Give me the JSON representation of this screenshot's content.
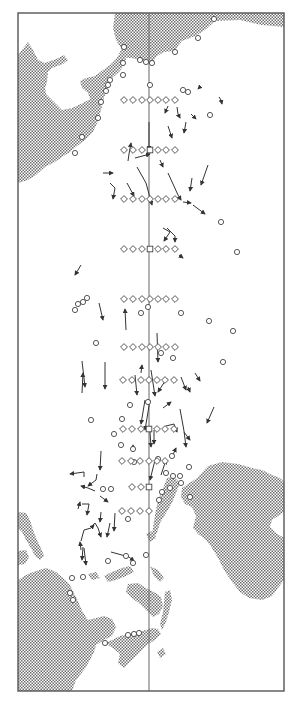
{
  "figure": {
    "type": "oceanographic station and drift-track map",
    "width": 290,
    "height": 707,
    "frame": {
      "x": 18,
      "y": 13,
      "w": 266,
      "h": 678
    },
    "meridian_x": 149,
    "colors": {
      "land_dot": "#7a7a7a",
      "line": "#333333",
      "frame": "#555555",
      "background": "#ffffff"
    }
  },
  "legend": {
    "diamond": "hydrographic station",
    "square": "station on reference meridian",
    "circle": "coastal / island observation site",
    "arrow": "drift trajectory"
  },
  "station_rows": [
    {
      "y": 100,
      "xs": [
        124,
        133,
        142,
        150,
        158,
        166,
        175
      ]
    },
    {
      "y": 150,
      "xs": [
        124,
        133,
        142,
        150,
        158,
        166,
        175
      ]
    },
    {
      "y": 199,
      "xs": [
        124,
        133,
        142,
        150,
        158,
        166,
        175
      ]
    },
    {
      "y": 249,
      "xs": [
        124,
        133,
        142,
        150,
        158,
        166,
        175
      ]
    },
    {
      "y": 299,
      "xs": [
        124,
        133,
        142,
        150,
        158,
        166,
        175
      ]
    },
    {
      "y": 347,
      "xs": [
        124,
        133,
        142,
        150,
        158,
        166,
        175
      ]
    },
    {
      "y": 380,
      "xs": [
        123,
        132,
        141,
        149,
        157,
        165,
        174
      ]
    },
    {
      "y": 429,
      "xs": [
        123,
        132,
        141,
        149,
        157,
        165,
        174
      ]
    },
    {
      "y": 461,
      "xs": [
        122,
        131,
        140,
        149,
        157,
        165
      ]
    },
    {
      "y": 487,
      "xs": [
        132,
        141,
        149
      ]
    },
    {
      "y": 511,
      "xs": [
        122,
        131,
        140,
        149
      ]
    }
  ],
  "square_stations": [
    {
      "x": 150,
      "y": 150
    },
    {
      "x": 150,
      "y": 249
    },
    {
      "x": 149,
      "y": 429
    },
    {
      "x": 149,
      "y": 487
    },
    {
      "x": 149,
      "y": 347
    }
  ],
  "circles": [
    [
      124,
      47
    ],
    [
      140,
      60
    ],
    [
      146,
      62
    ],
    [
      152,
      63
    ],
    [
      175,
      52
    ],
    [
      198,
      38
    ],
    [
      214,
      19
    ],
    [
      123,
      63
    ],
    [
      123,
      75
    ],
    [
      110,
      80
    ],
    [
      108,
      85
    ],
    [
      106,
      91
    ],
    [
      101,
      102
    ],
    [
      98,
      118
    ],
    [
      82,
      137
    ],
    [
      75,
      153
    ],
    [
      150,
      85
    ],
    [
      183,
      90
    ],
    [
      188,
      92
    ],
    [
      210,
      115
    ],
    [
      221,
      222
    ],
    [
      237,
      252
    ],
    [
      87,
      298
    ],
    [
      83,
      302
    ],
    [
      78,
      304
    ],
    [
      75,
      310
    ],
    [
      96,
      343
    ],
    [
      148,
      307
    ],
    [
      141,
      313
    ],
    [
      181,
      313
    ],
    [
      233,
      331
    ],
    [
      209,
      321
    ],
    [
      223,
      362
    ],
    [
      173,
      358
    ],
    [
      161,
      353
    ],
    [
      148,
      402
    ],
    [
      130,
      405
    ],
    [
      91,
      420
    ],
    [
      122,
      419
    ],
    [
      114,
      434
    ],
    [
      121,
      445
    ],
    [
      133,
      449
    ],
    [
      134,
      462
    ],
    [
      158,
      459
    ],
    [
      170,
      488
    ],
    [
      162,
      492
    ],
    [
      159,
      500
    ],
    [
      172,
      456
    ],
    [
      166,
      473
    ],
    [
      173,
      476
    ],
    [
      180,
      476
    ],
    [
      189,
      467
    ],
    [
      181,
      483
    ],
    [
      190,
      497
    ],
    [
      103,
      489
    ],
    [
      111,
      489
    ],
    [
      128,
      519
    ],
    [
      146,
      555
    ],
    [
      126,
      556
    ],
    [
      133,
      563
    ],
    [
      72,
      578
    ],
    [
      83,
      577
    ],
    [
      108,
      561
    ],
    [
      70,
      593
    ],
    [
      73,
      600
    ],
    [
      128,
      635
    ],
    [
      134,
      634
    ],
    [
      139,
      633
    ],
    [
      105,
      643
    ]
  ],
  "tracks": [
    [
      [
        219,
        97
      ],
      [
        221,
        100
      ],
      [
        222,
        104
      ]
    ],
    [
      [
        201,
        86
      ],
      [
        198,
        89
      ]
    ],
    [
      [
        168,
        106
      ],
      [
        165,
        113
      ]
    ],
    [
      [
        177,
        107
      ],
      [
        178,
        114
      ],
      [
        180,
        118
      ]
    ],
    [
      [
        191,
        114
      ],
      [
        196,
        119
      ]
    ],
    [
      [
        186,
        122
      ],
      [
        184,
        133
      ]
    ],
    [
      [
        168,
        126
      ],
      [
        172,
        138
      ]
    ],
    [
      [
        149,
        122
      ],
      [
        149,
        150
      ]
    ],
    [
      [
        128,
        161
      ],
      [
        129,
        154
      ],
      [
        131,
        143
      ]
    ],
    [
      [
        135,
        158
      ],
      [
        150,
        154
      ]
    ],
    [
      [
        160,
        160
      ],
      [
        163,
        167
      ]
    ],
    [
      [
        103,
        173
      ],
      [
        113,
        173
      ]
    ],
    [
      [
        110,
        183
      ],
      [
        115,
        188
      ],
      [
        113,
        199
      ]
    ],
    [
      [
        127,
        183
      ],
      [
        134,
        196
      ]
    ],
    [
      [
        137,
        167
      ],
      [
        146,
        183
      ],
      [
        152,
        205
      ]
    ],
    [
      [
        168,
        173
      ],
      [
        178,
        195
      ],
      [
        181,
        200
      ]
    ],
    [
      [
        192,
        178
      ],
      [
        190,
        191
      ]
    ],
    [
      [
        208,
        165
      ],
      [
        201,
        185
      ]
    ],
    [
      [
        183,
        202
      ],
      [
        191,
        203
      ]
    ],
    [
      [
        193,
        205
      ],
      [
        205,
        214
      ]
    ],
    [
      [
        163,
        228
      ],
      [
        170,
        232
      ],
      [
        164,
        241
      ]
    ],
    [
      [
        167,
        228
      ],
      [
        175,
        236
      ],
      [
        175,
        242
      ]
    ],
    [
      [
        179,
        255
      ],
      [
        183,
        258
      ]
    ],
    [
      [
        81,
        265
      ],
      [
        75,
        275
      ]
    ],
    [
      [
        99,
        303
      ],
      [
        103,
        320
      ]
    ],
    [
      [
        126,
        330
      ],
      [
        125,
        309
      ]
    ],
    [
      [
        82,
        361
      ],
      [
        85,
        387
      ]
    ],
    [
      [
        141,
        373
      ],
      [
        142,
        365
      ]
    ],
    [
      [
        157,
        333
      ],
      [
        158,
        362
      ]
    ],
    [
      [
        167,
        378
      ],
      [
        158,
        392
      ]
    ],
    [
      [
        82,
        393
      ],
      [
        83,
        373
      ]
    ],
    [
      [
        105,
        362
      ],
      [
        105,
        389
      ]
    ],
    [
      [
        135,
        375
      ],
      [
        137,
        395
      ]
    ],
    [
      [
        151,
        370
      ],
      [
        155,
        396
      ]
    ],
    [
      [
        145,
        400
      ],
      [
        141,
        424
      ]
    ],
    [
      [
        150,
        400
      ],
      [
        145,
        430
      ]
    ],
    [
      [
        154,
        430
      ],
      [
        154,
        444
      ]
    ],
    [
      [
        163,
        408
      ],
      [
        171,
        402
      ]
    ],
    [
      [
        166,
        426
      ],
      [
        174,
        424
      ],
      [
        177,
        432
      ]
    ],
    [
      [
        180,
        409
      ],
      [
        184,
        431
      ],
      [
        186,
        447
      ]
    ],
    [
      [
        184,
        432
      ],
      [
        190,
        440
      ]
    ],
    [
      [
        214,
        407
      ],
      [
        207,
        423
      ]
    ],
    [
      [
        195,
        373
      ],
      [
        200,
        381
      ]
    ],
    [
      [
        181,
        377
      ],
      [
        186,
        390
      ]
    ],
    [
      [
        188,
        387
      ],
      [
        190,
        392
      ]
    ],
    [
      [
        150,
        432
      ],
      [
        151,
        447
      ]
    ],
    [
      [
        101,
        451
      ],
      [
        100,
        470
      ]
    ],
    [
      [
        133,
        452
      ],
      [
        133,
        445
      ]
    ],
    [
      [
        155,
        460
      ],
      [
        150,
        480
      ]
    ],
    [
      [
        161,
        475
      ],
      [
        166,
        460
      ]
    ],
    [
      [
        172,
        457
      ],
      [
        176,
        448
      ]
    ],
    [
      [
        97,
        474
      ],
      [
        96,
        480
      ],
      [
        88,
        486
      ]
    ],
    [
      [
        84,
        477
      ],
      [
        84,
        472
      ],
      [
        70,
        474
      ]
    ],
    [
      [
        95,
        491
      ],
      [
        88,
        488
      ],
      [
        81,
        486
      ]
    ],
    [
      [
        100,
        496
      ],
      [
        108,
        502
      ]
    ],
    [
      [
        82,
        504
      ],
      [
        89,
        504
      ],
      [
        87,
        515
      ]
    ],
    [
      [
        78,
        509
      ],
      [
        80,
        502
      ]
    ],
    [
      [
        101,
        512
      ],
      [
        100,
        522
      ]
    ],
    [
      [
        115,
        513
      ],
      [
        114,
        531
      ]
    ],
    [
      [
        110,
        523
      ],
      [
        107,
        537
      ]
    ],
    [
      [
        81,
        550
      ],
      [
        80,
        542
      ]
    ],
    [
      [
        92,
        526
      ],
      [
        95,
        523
      ],
      [
        98,
        528
      ],
      [
        101,
        537
      ]
    ],
    [
      [
        81,
        541
      ],
      [
        84,
        530
      ],
      [
        91,
        528
      ],
      [
        94,
        525
      ]
    ],
    [
      [
        83,
        547
      ],
      [
        82,
        560
      ]
    ],
    [
      [
        84,
        548
      ],
      [
        86,
        565
      ]
    ],
    [
      [
        111,
        552
      ],
      [
        129,
        557
      ],
      [
        134,
        561
      ]
    ]
  ]
}
